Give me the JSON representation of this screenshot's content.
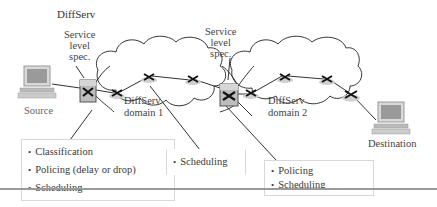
{
  "title": "DiffServ",
  "labels": {
    "sls_left": [
      "Service",
      "level",
      "spec."
    ],
    "sls_right": [
      "Service",
      "level",
      "spec."
    ],
    "domain1": [
      "DiffServ",
      "domain 1"
    ],
    "domain2": [
      "DiffServ",
      "domain 2"
    ],
    "source": "Source",
    "destination": "Destination"
  },
  "boxes": {
    "ingress": [
      "Classification",
      "Policing (delay or drop)",
      "Scheduling"
    ],
    "interior": [
      "Scheduling"
    ],
    "boundary": [
      "Policing",
      "Scheduling"
    ]
  },
  "icons": {
    "source_host": "computer-icon",
    "destination_host": "computer-icon",
    "edge_router": "router-icon",
    "core_router": "router-icon",
    "cloud": "cloud-icon"
  },
  "colors": {
    "line": "#333333",
    "router_fill": "#c8c8c8",
    "router_edge_fill": "#b9b9b9",
    "box_border": "#d8d8d8",
    "rule": "#9a9a9a"
  }
}
